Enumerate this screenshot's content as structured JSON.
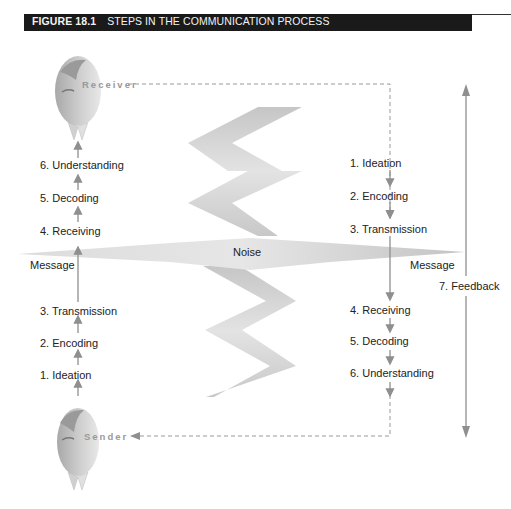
{
  "figure": {
    "number": "FIGURE 18.1",
    "title": "STEPS IN THE COMMUNICATION PROCESS"
  },
  "roles": {
    "receiver": "Receiver",
    "sender": "Sender"
  },
  "band": {
    "noise": "Noise",
    "message_left": "Message",
    "message_right": "Message"
  },
  "left_column": {
    "steps": [
      "6. Understanding",
      "5. Decoding",
      "4. Receiving",
      "3. Transmission",
      "2. Encoding",
      "1. Ideation"
    ]
  },
  "right_column": {
    "steps": [
      "1. Ideation",
      "2. Encoding",
      "3. Transmission",
      "4. Receiving",
      "5. Decoding",
      "6. Understanding"
    ]
  },
  "feedback": {
    "label": "7. Feedback"
  },
  "colors": {
    "header_bg": "#1a1a1a",
    "arrow": "#8f8f8f",
    "noise_fill": "#d4d4d4",
    "text": "#222222"
  }
}
